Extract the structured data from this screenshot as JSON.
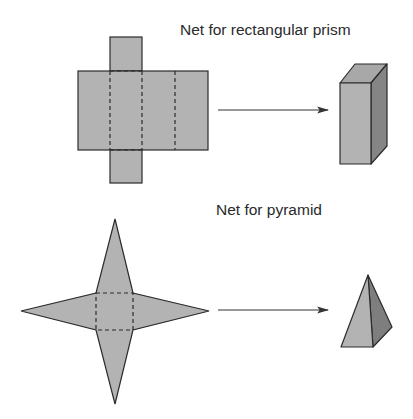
{
  "diagram": {
    "sections": [
      {
        "title": "Net for rectangular prism",
        "net": "cross-shaped net of six rectangles with dashed fold lines",
        "result": "rectangular prism (3D box)"
      },
      {
        "title": "Net for pyramid",
        "net": "square base with four triangles (star shape) and dashed fold lines",
        "result": "square pyramid (3D)"
      }
    ],
    "colors": {
      "fill": "#b3b3b3",
      "side_dark": "#8a8a8a",
      "top_face": "#a6a6a6",
      "stroke": "#2b2b2b",
      "arrow": "#333333"
    },
    "icons": [
      "arrow-right-icon",
      "arrow-right-icon"
    ]
  }
}
